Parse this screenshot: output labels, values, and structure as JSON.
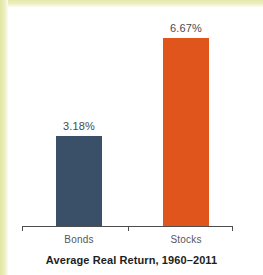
{
  "chart_data": {
    "type": "bar",
    "title": "Average Real Return, 1960–2011",
    "xlabel": "",
    "ylabel": "",
    "categories": [
      "Bonds",
      "Stocks"
    ],
    "values": [
      3.18,
      6.67
    ],
    "value_labels": [
      "3.18%",
      "6.67%"
    ],
    "units": "percent",
    "ylim": [
      0,
      7.1
    ],
    "grid": false,
    "legend": null,
    "series": [
      {
        "name": "Average Real Return",
        "values": [
          3.18,
          6.67
        ],
        "colors": [
          "#3a5068",
          "#e0551c"
        ]
      }
    ],
    "axis": {
      "baseline_visible": true,
      "tick_count": 3,
      "tick_positions": [
        "left-end",
        "between-bars",
        "right-end"
      ]
    }
  },
  "colors": {
    "bonds_bar": "#3a5068",
    "stocks_bar": "#e0551c",
    "axis": "#4d4d4d",
    "value_text": "#4a4a4a",
    "category_text": "#55585c",
    "caption_text": "#1d1d1d",
    "background": "#ffffff",
    "scan_edge": "#e4e9a8"
  }
}
